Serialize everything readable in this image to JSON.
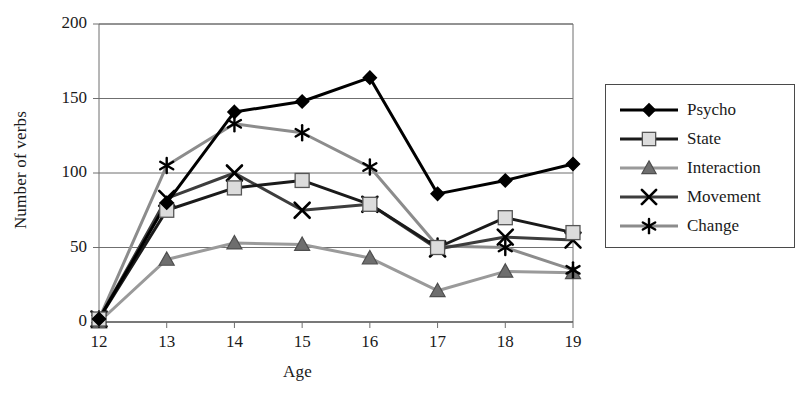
{
  "chart_data": {
    "type": "line",
    "title": "",
    "xlabel": "Age",
    "ylabel": "Number of verbs",
    "categories": [
      "12",
      "13",
      "14",
      "15",
      "16",
      "17",
      "18",
      "19"
    ],
    "x": [
      12,
      13,
      14,
      15,
      16,
      17,
      18,
      19
    ],
    "xlim": [
      12,
      19
    ],
    "ylim": [
      0,
      200
    ],
    "yticks": [
      "0",
      "50",
      "100",
      "150",
      "200"
    ],
    "ytick_values": [
      0,
      50,
      100,
      150,
      200
    ],
    "grid": "horizontal",
    "legend_position": "right-outside",
    "series": [
      {
        "name": "Psycho",
        "marker": "diamond",
        "color": "#000000",
        "marker_fill": "#000000",
        "values": [
          2,
          80,
          141,
          148,
          164,
          86,
          95,
          106
        ]
      },
      {
        "name": "State",
        "marker": "square",
        "color": "#1a1a1a",
        "marker_fill": "#dcdcdc",
        "values": [
          2,
          75,
          90,
          95,
          79,
          50,
          70,
          60
        ]
      },
      {
        "name": "Interaction",
        "marker": "triangle",
        "color": "#9a9a9a",
        "marker_fill": "#6e6e6e",
        "values": [
          0,
          42,
          53,
          52,
          43,
          21,
          34,
          33
        ]
      },
      {
        "name": "Movement",
        "marker": "x",
        "color": "#3d3d3d",
        "marker_fill": "#000000",
        "values": [
          2,
          83,
          100,
          75,
          79,
          49,
          57,
          55
        ]
      },
      {
        "name": "Change",
        "marker": "asterisk",
        "color": "#8c8c8c",
        "marker_fill": "#000000",
        "values": [
          2,
          105,
          133,
          127,
          104,
          51,
          50,
          35
        ]
      }
    ]
  },
  "legend": {
    "items": [
      {
        "label": "Psycho"
      },
      {
        "label": "State"
      },
      {
        "label": "Interaction"
      },
      {
        "label": "Movement"
      },
      {
        "label": "Change"
      }
    ]
  }
}
